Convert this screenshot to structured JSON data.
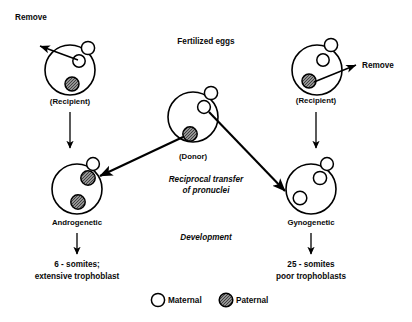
{
  "diagram": {
    "title": "Fertilized eggs",
    "process_label_line1": "Reciprocal transfer",
    "process_label_line2": "of pronuclei",
    "development_label": "Development",
    "remove_left": "Remove",
    "remove_right": "Remove",
    "recipient_left": "(Recipient)",
    "recipient_right": "(Recipient)",
    "donor": "(Donor)",
    "androgenetic": "Androgenetic",
    "gynogenetic": "Gynogenetic",
    "outcome_left_line1": "6 - somites;",
    "outcome_left_line2": "extensive trophoblast",
    "outcome_right_line1": "25 - somites",
    "outcome_right_line2": "poor trophoblasts",
    "legend": {
      "maternal": "Maternal",
      "paternal": "Paternal"
    },
    "colors": {
      "stroke": "#000000",
      "background": "#ffffff",
      "maternal_fill": "#ffffff",
      "paternal_fill": "#9a9a9a"
    }
  }
}
